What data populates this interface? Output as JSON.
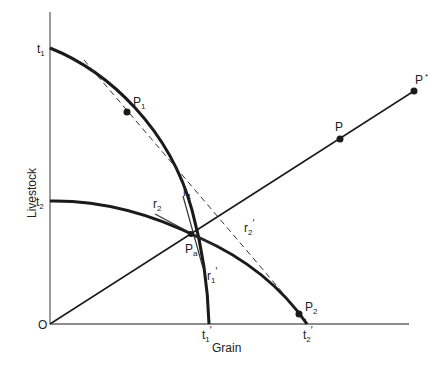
{
  "axes": {
    "y_label": "Livestock",
    "x_label": "Grain",
    "origin_label": "O"
  },
  "curves": {
    "outer": {
      "start_label": "t",
      "start_sub": "1",
      "end_label": "t",
      "end_sub": "1",
      "end_prime": "′"
    },
    "inner": {
      "start_label": "t",
      "start_sub": "2",
      "end_label": "t",
      "end_sub": "2",
      "end_prime": "′"
    }
  },
  "points": {
    "p1": {
      "label": "P",
      "sub": "1"
    },
    "p2": {
      "label": "P",
      "sub": "2"
    },
    "pa": {
      "label": "P",
      "sub": "a"
    },
    "p": {
      "label": "P"
    },
    "pstar": {
      "label": "P",
      "sup": "*"
    }
  },
  "tangents": {
    "r1": {
      "label": "r",
      "sub": "1"
    },
    "r1p": {
      "label": "r",
      "sub": "1",
      "prime": "′"
    },
    "r2": {
      "label": "r",
      "sub": "2"
    },
    "r2p": {
      "label": "r",
      "sub": "2",
      "prime": "′"
    }
  },
  "colors": {
    "line": "#1a1a1a",
    "axis": "#555555"
  }
}
